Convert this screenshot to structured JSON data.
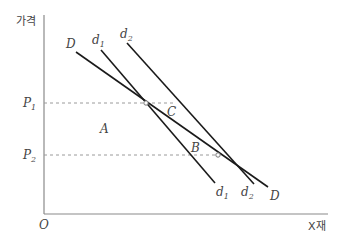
{
  "diagram": {
    "type": "supply-demand economics diagram",
    "y_axis_label": "가격",
    "x_axis_label": "X재",
    "origin_label": "O",
    "price_levels": [
      {
        "label": "P",
        "sub": "1",
        "y": 103
      },
      {
        "label": "P",
        "sub": "2",
        "y": 155
      }
    ],
    "curves": [
      {
        "id": "D",
        "label": "D",
        "sub": "",
        "x1": 76,
        "y1": 52,
        "x2": 268,
        "y2": 187,
        "end_label": "D",
        "end_sub": ""
      },
      {
        "id": "d1",
        "label": "d",
        "sub": "1",
        "x1": 101,
        "y1": 50,
        "x2": 215,
        "y2": 183,
        "end_label": "d",
        "end_sub": "1"
      },
      {
        "id": "d2",
        "label": "d",
        "sub": "2",
        "x1": 127,
        "y1": 43,
        "x2": 254,
        "y2": 184,
        "end_label": "d",
        "end_sub": "2"
      }
    ],
    "points": [
      {
        "id": "intersection-p1",
        "x": 146,
        "y": 103
      },
      {
        "id": "intersection-p2",
        "x": 218,
        "y": 155
      }
    ],
    "region_labels": [
      {
        "text": "A",
        "x": 100,
        "y": 133
      },
      {
        "text": "C",
        "x": 167,
        "y": 116
      },
      {
        "text": "B",
        "x": 191,
        "y": 152
      }
    ]
  }
}
